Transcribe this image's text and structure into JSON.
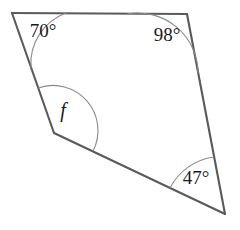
{
  "figure": {
    "shape_name": "quadrilateral",
    "outline_color": "#5a5a5a",
    "arc_color": "#8a8a8a",
    "label_color": "#1a1a1a",
    "background_color": "#ffffff",
    "vertices": [
      {
        "name": "top-left",
        "x": 12,
        "y": 13
      },
      {
        "name": "top-right",
        "x": 187,
        "y": 14
      },
      {
        "name": "bottom-right",
        "x": 225,
        "y": 214
      },
      {
        "name": "left",
        "x": 54,
        "y": 133
      }
    ],
    "edges": [
      {
        "name": "top-edge",
        "from": "top-left",
        "to": "top-right"
      },
      {
        "name": "right-edge",
        "from": "top-right",
        "to": "bottom-right"
      },
      {
        "name": "bottom-edge",
        "from": "bottom-right",
        "to": "left"
      },
      {
        "name": "upper-left-edge",
        "from": "left",
        "to": "top-left"
      }
    ],
    "angles": [
      {
        "name": "angle-top-left",
        "label": "70°",
        "value": 70,
        "vertex": "top-left",
        "label_x": 43,
        "label_y": 33,
        "arc_radius": 54,
        "arc": {
          "start_x": 66,
          "start_y": 13,
          "end_x": 31,
          "end_y": 68,
          "sweep": 0
        }
      },
      {
        "name": "angle-top-right",
        "label": "98°",
        "value": 98,
        "vertex": "top-right",
        "label_x": 167,
        "label_y": 37,
        "arc_radius": 60,
        "arc": {
          "start_x": 127,
          "start_y": 14,
          "end_x": 198,
          "end_y": 73,
          "sweep": 1
        }
      },
      {
        "name": "angle-bottom-right",
        "label": "47°",
        "value": 47,
        "vertex": "bottom-right",
        "label_x": 196,
        "label_y": 180,
        "arc_radius": 58,
        "arc": {
          "start_x": 170,
          "start_y": 188,
          "end_x": 214,
          "end_y": 157,
          "sweep": 1
        }
      },
      {
        "name": "angle-left-unknown",
        "label": "f",
        "value": null,
        "vertex": "left",
        "label_x": 63,
        "label_y": 112,
        "arc_radius": 45,
        "arc": {
          "start_x": 38,
          "start_y": 88,
          "end_x": 93,
          "end_y": 151,
          "sweep": 1
        }
      }
    ]
  }
}
